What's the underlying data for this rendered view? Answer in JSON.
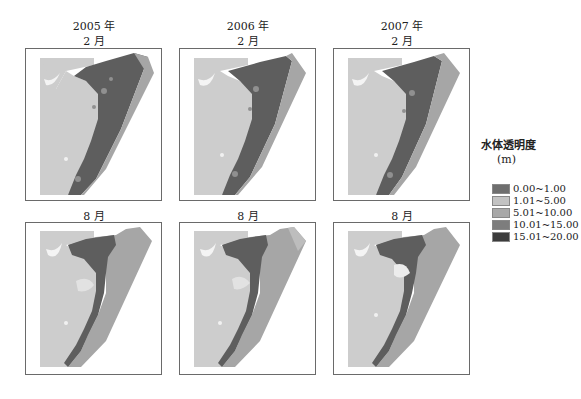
{
  "figure": {
    "columns": [
      {
        "year": "2005 年",
        "top_month": "2 月",
        "bottom_month": "8 月"
      },
      {
        "year": "2006 年",
        "top_month": "2 月",
        "bottom_month": "8 月"
      },
      {
        "year": "2007 年",
        "top_month": "2 月",
        "bottom_month": "8 月"
      }
    ]
  },
  "legend": {
    "title": "水体透明度",
    "unit": "(m)",
    "items": [
      {
        "label": "0.00~1.00",
        "color": "#6e6e6e"
      },
      {
        "label": "1.01~5.00",
        "color": "#c2c2c2"
      },
      {
        "label": "5.01~10.00",
        "color": "#a8a8a8"
      },
      {
        "label": "10.01~15.00",
        "color": "#7d7d7d"
      },
      {
        "label": "15.01~20.00",
        "color": "#3c3c3c"
      }
    ]
  },
  "colors": {
    "land": "#cdcdcd",
    "deep_water": "#5e5e5e",
    "shallow_sea": "#a9a9a9",
    "white_patch": "#f3f3f3",
    "border": "#6a6a6a"
  }
}
